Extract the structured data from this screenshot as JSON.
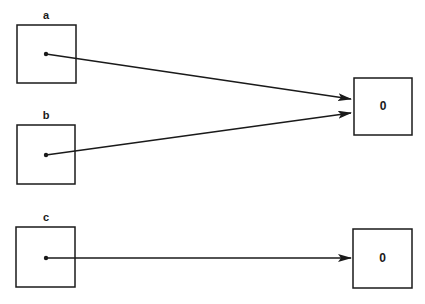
{
  "diagram": {
    "variables": [
      {
        "name": "a",
        "box": {
          "x": 17,
          "y": 25,
          "w": 59,
          "h": 58
        },
        "dot": {
          "x": 46,
          "y": 54
        },
        "target": 0
      },
      {
        "name": "b",
        "box": {
          "x": 17,
          "y": 125,
          "w": 58,
          "h": 59
        },
        "dot": {
          "x": 46,
          "y": 155
        },
        "target": 0
      },
      {
        "name": "c",
        "box": {
          "x": 16,
          "y": 227,
          "w": 59,
          "h": 60
        },
        "dot": {
          "x": 46,
          "y": 258
        },
        "target": 1
      }
    ],
    "objects": [
      {
        "value": "0",
        "box": {
          "x": 354,
          "y": 78,
          "w": 58,
          "h": 57
        }
      },
      {
        "value": "0",
        "box": {
          "x": 353,
          "y": 229,
          "w": 59,
          "h": 59
        }
      }
    ],
    "arrows": [
      {
        "from": "a",
        "x1": 46,
        "y1": 54,
        "x2": 351,
        "y2": 99
      },
      {
        "from": "b",
        "x1": 46,
        "y1": 155,
        "x2": 351,
        "y2": 113
      },
      {
        "from": "c",
        "x1": 46,
        "y1": 258,
        "x2": 351,
        "y2": 258
      }
    ],
    "line_color": "#1a1a1a"
  }
}
